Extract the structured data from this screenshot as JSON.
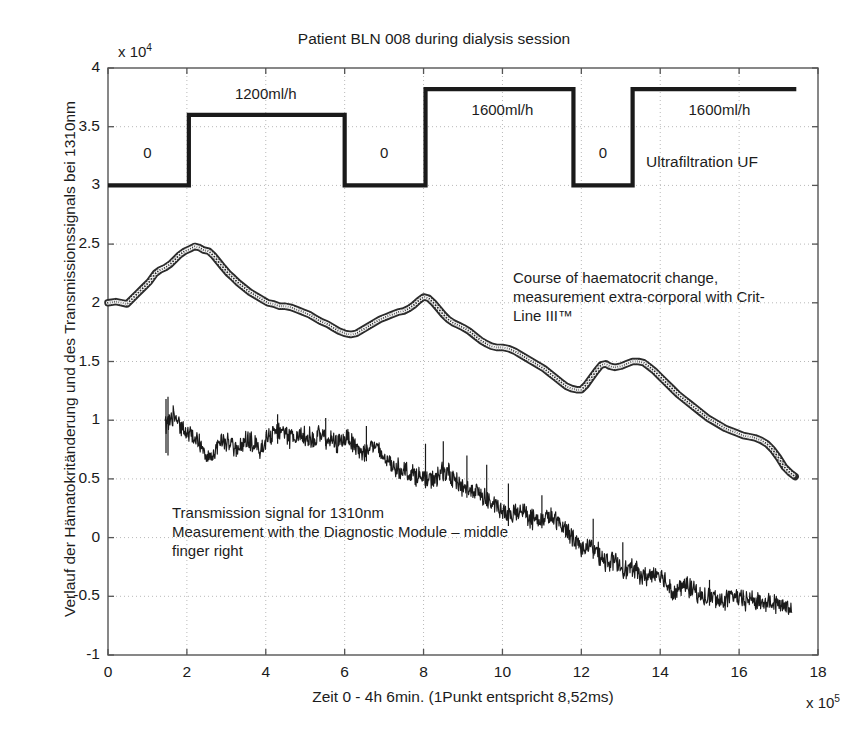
{
  "chart_data": {
    "type": "line",
    "title": "Patient BLN 008 during dialysis session",
    "xlabel": "Zeit 0 - 4h 6min. (1Punkt entspricht 8,52ms)",
    "ylabel": "Verlauf der Hämatokritänderung und des Transmissionssignals bei 1310nm",
    "x_exponent": "x 10",
    "x_exponent_power": "5",
    "y_exponent": "x 10",
    "y_exponent_power": "4",
    "xlim": [
      0,
      18
    ],
    "ylim": [
      -1,
      4
    ],
    "xticks": [
      0,
      2,
      4,
      6,
      8,
      10,
      12,
      14,
      16,
      18
    ],
    "xtick_labels": [
      "0",
      "2",
      "4",
      "6",
      "8",
      "10",
      "12",
      "14",
      "16",
      "18"
    ],
    "yticks": [
      -1,
      -0.5,
      0,
      0.5,
      1,
      1.5,
      2,
      2.5,
      3,
      3.5,
      4
    ],
    "ytick_labels": [
      "-1",
      "-0.5",
      "0",
      "0.5",
      "1",
      "1.5",
      "2",
      "2.5",
      "3",
      "3.5",
      "4"
    ],
    "grid": "dotted",
    "legend_position": "inline-annotations",
    "series": [
      {
        "name": "Ultrafiltration UF",
        "kind": "step",
        "color": "#1a1a1a",
        "annotation": "Ultrafiltration UF",
        "segments": [
          {
            "x_start": 0.0,
            "x_end": 2.05,
            "y": 3.0,
            "label": "0"
          },
          {
            "x_start": 2.05,
            "x_end": 6.0,
            "y": 3.6,
            "label": "1200ml/h"
          },
          {
            "x_start": 6.0,
            "x_end": 8.05,
            "y": 3.0,
            "label": "0"
          },
          {
            "x_start": 8.05,
            "x_end": 11.8,
            "y": 3.82,
            "label": "1600ml/h"
          },
          {
            "x_start": 11.8,
            "x_end": 13.3,
            "y": 3.0,
            "label": "0"
          },
          {
            "x_start": 13.3,
            "x_end": 17.45,
            "y": 3.82,
            "label": "1600ml/h"
          }
        ]
      },
      {
        "name": "Course of haematocrit change",
        "kind": "marker-line",
        "color": "#2b2b2b",
        "annotation": "Course of haematocrit change,\nmeasurement extra-corporal with Crit-\nLine III™",
        "points": [
          [
            0.0,
            2.0
          ],
          [
            0.2,
            2.01
          ],
          [
            0.35,
            2.0
          ],
          [
            0.48,
            1.99
          ],
          [
            0.6,
            2.03
          ],
          [
            0.75,
            2.08
          ],
          [
            0.9,
            2.13
          ],
          [
            1.05,
            2.18
          ],
          [
            1.2,
            2.25
          ],
          [
            1.32,
            2.28
          ],
          [
            1.45,
            2.3
          ],
          [
            1.58,
            2.33
          ],
          [
            1.7,
            2.37
          ],
          [
            1.82,
            2.41
          ],
          [
            1.95,
            2.44
          ],
          [
            2.08,
            2.46
          ],
          [
            2.2,
            2.48
          ],
          [
            2.32,
            2.47
          ],
          [
            2.42,
            2.45
          ],
          [
            2.55,
            2.44
          ],
          [
            2.68,
            2.4
          ],
          [
            2.8,
            2.35
          ],
          [
            2.92,
            2.3
          ],
          [
            3.05,
            2.25
          ],
          [
            3.18,
            2.21
          ],
          [
            3.3,
            2.17
          ],
          [
            3.45,
            2.13
          ],
          [
            3.6,
            2.09
          ],
          [
            3.75,
            2.06
          ],
          [
            3.9,
            2.03
          ],
          [
            4.05,
            2.0
          ],
          [
            4.2,
            1.99
          ],
          [
            4.35,
            1.97
          ],
          [
            4.5,
            1.97
          ],
          [
            4.65,
            1.96
          ],
          [
            4.8,
            1.94
          ],
          [
            4.95,
            1.92
          ],
          [
            5.1,
            1.9
          ],
          [
            5.25,
            1.87
          ],
          [
            5.4,
            1.84
          ],
          [
            5.55,
            1.82
          ],
          [
            5.7,
            1.79
          ],
          [
            5.85,
            1.76
          ],
          [
            6.0,
            1.74
          ],
          [
            6.15,
            1.73
          ],
          [
            6.3,
            1.74
          ],
          [
            6.45,
            1.77
          ],
          [
            6.6,
            1.8
          ],
          [
            6.75,
            1.83
          ],
          [
            6.9,
            1.86
          ],
          [
            7.05,
            1.88
          ],
          [
            7.2,
            1.9
          ],
          [
            7.35,
            1.92
          ],
          [
            7.5,
            1.93
          ],
          [
            7.62,
            1.95
          ],
          [
            7.75,
            1.98
          ],
          [
            7.88,
            2.02
          ],
          [
            8.0,
            2.05
          ],
          [
            8.12,
            2.04
          ],
          [
            8.25,
            2.0
          ],
          [
            8.38,
            1.95
          ],
          [
            8.5,
            1.9
          ],
          [
            8.62,
            1.86
          ],
          [
            8.75,
            1.83
          ],
          [
            8.88,
            1.81
          ],
          [
            9.0,
            1.79
          ],
          [
            9.15,
            1.76
          ],
          [
            9.3,
            1.72
          ],
          [
            9.45,
            1.68
          ],
          [
            9.6,
            1.65
          ],
          [
            9.72,
            1.63
          ],
          [
            9.85,
            1.62
          ],
          [
            10.0,
            1.62
          ],
          [
            10.15,
            1.61
          ],
          [
            10.3,
            1.59
          ],
          [
            10.45,
            1.56
          ],
          [
            10.6,
            1.53
          ],
          [
            10.75,
            1.5
          ],
          [
            10.9,
            1.47
          ],
          [
            11.05,
            1.44
          ],
          [
            11.2,
            1.4
          ],
          [
            11.35,
            1.36
          ],
          [
            11.5,
            1.32
          ],
          [
            11.62,
            1.29
          ],
          [
            11.75,
            1.27
          ],
          [
            11.88,
            1.26
          ],
          [
            12.0,
            1.26
          ],
          [
            12.12,
            1.3
          ],
          [
            12.25,
            1.36
          ],
          [
            12.38,
            1.42
          ],
          [
            12.5,
            1.47
          ],
          [
            12.62,
            1.48
          ],
          [
            12.72,
            1.46
          ],
          [
            12.85,
            1.45
          ],
          [
            13.0,
            1.46
          ],
          [
            13.15,
            1.48
          ],
          [
            13.3,
            1.5
          ],
          [
            13.45,
            1.5
          ],
          [
            13.58,
            1.49
          ],
          [
            13.7,
            1.46
          ],
          [
            13.85,
            1.42
          ],
          [
            14.0,
            1.37
          ],
          [
            14.15,
            1.32
          ],
          [
            14.3,
            1.27
          ],
          [
            14.45,
            1.22
          ],
          [
            14.6,
            1.18
          ],
          [
            14.75,
            1.14
          ],
          [
            14.9,
            1.1
          ],
          [
            15.05,
            1.06
          ],
          [
            15.2,
            1.02
          ],
          [
            15.35,
            0.99
          ],
          [
            15.5,
            0.96
          ],
          [
            15.65,
            0.93
          ],
          [
            15.8,
            0.91
          ],
          [
            15.95,
            0.89
          ],
          [
            16.1,
            0.87
          ],
          [
            16.25,
            0.86
          ],
          [
            16.4,
            0.85
          ],
          [
            16.55,
            0.83
          ],
          [
            16.7,
            0.8
          ],
          [
            16.85,
            0.75
          ],
          [
            17.0,
            0.68
          ],
          [
            17.15,
            0.6
          ],
          [
            17.3,
            0.55
          ],
          [
            17.42,
            0.52
          ]
        ]
      },
      {
        "name": "Transmission signal for 1310nm",
        "kind": "noisy-line",
        "color": "#1a1a1a",
        "annotation": "Transmission signal for 1310nm\nMeasurement with the Diagnostic Module – middle\nfinger right",
        "baseline": [
          [
            1.45,
            0.95
          ],
          [
            1.6,
            1.05
          ],
          [
            1.75,
            1.0
          ],
          [
            1.9,
            0.93
          ],
          [
            2.05,
            0.88
          ],
          [
            2.2,
            0.86
          ],
          [
            2.35,
            0.8
          ],
          [
            2.5,
            0.72
          ],
          [
            2.65,
            0.69
          ],
          [
            2.8,
            0.78
          ],
          [
            2.95,
            0.83
          ],
          [
            3.1,
            0.8
          ],
          [
            3.25,
            0.74
          ],
          [
            3.4,
            0.78
          ],
          [
            3.55,
            0.84
          ],
          [
            3.7,
            0.8
          ],
          [
            3.85,
            0.76
          ],
          [
            4.0,
            0.82
          ],
          [
            4.15,
            0.88
          ],
          [
            4.3,
            0.92
          ],
          [
            4.45,
            0.88
          ],
          [
            4.6,
            0.85
          ],
          [
            4.75,
            0.86
          ],
          [
            4.9,
            0.88
          ],
          [
            5.05,
            0.86
          ],
          [
            5.2,
            0.84
          ],
          [
            5.35,
            0.87
          ],
          [
            5.5,
            0.85
          ],
          [
            5.65,
            0.82
          ],
          [
            5.8,
            0.8
          ],
          [
            5.95,
            0.84
          ],
          [
            6.1,
            0.86
          ],
          [
            6.25,
            0.8
          ],
          [
            6.4,
            0.72
          ],
          [
            6.55,
            0.75
          ],
          [
            6.7,
            0.79
          ],
          [
            6.85,
            0.74
          ],
          [
            7.0,
            0.68
          ],
          [
            7.15,
            0.63
          ],
          [
            7.3,
            0.6
          ],
          [
            7.45,
            0.58
          ],
          [
            7.6,
            0.56
          ],
          [
            7.75,
            0.54
          ],
          [
            7.9,
            0.52
          ],
          [
            8.05,
            0.5
          ],
          [
            8.2,
            0.48
          ],
          [
            8.35,
            0.52
          ],
          [
            8.5,
            0.58
          ],
          [
            8.65,
            0.54
          ],
          [
            8.8,
            0.48
          ],
          [
            8.95,
            0.44
          ],
          [
            9.1,
            0.42
          ],
          [
            9.25,
            0.4
          ],
          [
            9.4,
            0.38
          ],
          [
            9.55,
            0.34
          ],
          [
            9.7,
            0.3
          ],
          [
            9.85,
            0.26
          ],
          [
            10.0,
            0.22
          ],
          [
            10.15,
            0.18
          ],
          [
            10.3,
            0.2
          ],
          [
            10.45,
            0.24
          ],
          [
            10.6,
            0.21
          ],
          [
            10.75,
            0.16
          ],
          [
            10.9,
            0.14
          ],
          [
            11.05,
            0.16
          ],
          [
            11.2,
            0.18
          ],
          [
            11.35,
            0.14
          ],
          [
            11.5,
            0.1
          ],
          [
            11.65,
            0.06
          ],
          [
            11.8,
            0.0
          ],
          [
            11.95,
            -0.06
          ],
          [
            12.1,
            -0.1
          ],
          [
            12.25,
            -0.08
          ],
          [
            12.4,
            -0.12
          ],
          [
            12.55,
            -0.18
          ],
          [
            12.7,
            -0.22
          ],
          [
            12.85,
            -0.2
          ],
          [
            13.0,
            -0.24
          ],
          [
            13.15,
            -0.28
          ],
          [
            13.3,
            -0.26
          ],
          [
            13.45,
            -0.3
          ],
          [
            13.6,
            -0.34
          ],
          [
            13.75,
            -0.32
          ],
          [
            13.9,
            -0.3
          ],
          [
            14.05,
            -0.34
          ],
          [
            14.2,
            -0.4
          ],
          [
            14.35,
            -0.46
          ],
          [
            14.5,
            -0.44
          ],
          [
            14.65,
            -0.4
          ],
          [
            14.8,
            -0.44
          ],
          [
            14.95,
            -0.48
          ],
          [
            15.1,
            -0.52
          ],
          [
            15.25,
            -0.5
          ],
          [
            15.4,
            -0.52
          ],
          [
            15.55,
            -0.54
          ],
          [
            15.7,
            -0.52
          ],
          [
            15.85,
            -0.5
          ],
          [
            16.0,
            -0.52
          ],
          [
            16.15,
            -0.54
          ],
          [
            16.3,
            -0.52
          ],
          [
            16.45,
            -0.54
          ],
          [
            16.6,
            -0.56
          ],
          [
            16.75,
            -0.54
          ],
          [
            16.9,
            -0.56
          ],
          [
            17.05,
            -0.58
          ],
          [
            17.2,
            -0.57
          ],
          [
            17.35,
            -0.59
          ]
        ],
        "noise_amplitude": 0.07,
        "spikes": [
          {
            "x": 1.47,
            "y_top": 1.18,
            "y_bottom": 0.72
          },
          {
            "x": 1.52,
            "y_top": 1.2,
            "y_bottom": 0.7
          },
          {
            "x": 4.3,
            "y_top": 1.05,
            "y_bottom": 0.8
          },
          {
            "x": 5.52,
            "y_top": 1.02,
            "y_bottom": 0.78
          },
          {
            "x": 6.55,
            "y_top": 0.95,
            "y_bottom": 0.65
          },
          {
            "x": 8.05,
            "y_top": 0.8,
            "y_bottom": 0.42
          },
          {
            "x": 8.5,
            "y_top": 0.82,
            "y_bottom": 0.48
          },
          {
            "x": 9.1,
            "y_top": 0.7,
            "y_bottom": 0.34
          },
          {
            "x": 9.6,
            "y_top": 0.62,
            "y_bottom": 0.28
          },
          {
            "x": 10.15,
            "y_top": 0.46,
            "y_bottom": 0.1
          },
          {
            "x": 11.0,
            "y_top": 0.36,
            "y_bottom": 0.08
          },
          {
            "x": 12.3,
            "y_top": 0.16,
            "y_bottom": -0.18
          },
          {
            "x": 13.05,
            "y_top": -0.04,
            "y_bottom": -0.3
          },
          {
            "x": 15.25,
            "y_top": -0.36,
            "y_bottom": -0.58
          }
        ]
      }
    ]
  },
  "step_labels": [
    {
      "text": "0",
      "x": 1.0,
      "y": 3.27
    },
    {
      "text": "1200ml/h",
      "x": 4.0,
      "y": 3.77
    },
    {
      "text": "0",
      "x": 7.0,
      "y": 3.27
    },
    {
      "text": "1600ml/h",
      "x": 10.0,
      "y": 3.63
    },
    {
      "text": "0",
      "x": 12.55,
      "y": 3.27
    },
    {
      "text": "1600ml/h",
      "x": 15.5,
      "y": 3.63
    }
  ],
  "annotations": {
    "haematocrit": "Course of haematocrit change,\nmeasurement extra-corporal with Crit-\nLine III™",
    "transmission": "Transmission signal for 1310nm\nMeasurement with the Diagnostic Module – middle\nfinger right",
    "ultrafiltration": "Ultrafiltration UF"
  }
}
